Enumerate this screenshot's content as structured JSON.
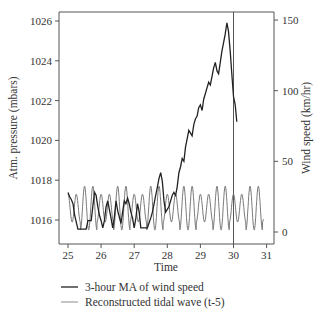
{
  "chart_data": {
    "type": "line",
    "title": "",
    "xlabel": "Time",
    "ylabel_left": "Atm. pressure (mbars)",
    "ylabel_right": "Wind speed (km/hr)",
    "xlim": [
      25,
      31
    ],
    "ylim_left": [
      1015.2,
      1026.5
    ],
    "ylim_right": [
      -8,
      150
    ],
    "x_ticks": [
      "25",
      "26",
      "27",
      "28",
      "29",
      "30",
      "31"
    ],
    "y_left_ticks": [
      "1016",
      "1018",
      "1020",
      "1022",
      "1024",
      "1026"
    ],
    "y_right_ticks": [
      "0",
      "50",
      "100",
      "150"
    ],
    "grid": false,
    "vertical_marker_x": 30,
    "legend_position": "bottom",
    "series": [
      {
        "name": "3-hour MA of wind speed",
        "axis": "right",
        "color": "#222222",
        "x": [
          25.0,
          25.05,
          25.1,
          25.15,
          25.2,
          25.3,
          25.4,
          25.5,
          25.55,
          25.6,
          25.65,
          25.7,
          25.75,
          25.8,
          25.85,
          25.9,
          25.95,
          26.0,
          26.05,
          26.1,
          26.15,
          26.2,
          26.3,
          26.35,
          26.4,
          26.45,
          26.5,
          26.6,
          26.65,
          26.7,
          26.75,
          26.8,
          26.85,
          26.9,
          26.95,
          27.0,
          27.05,
          27.1,
          27.15,
          27.2,
          27.3,
          27.4,
          27.5,
          27.55,
          27.6,
          27.65,
          27.7,
          27.75,
          27.8,
          27.85,
          27.9,
          27.95,
          28.0,
          28.05,
          28.1,
          28.15,
          28.2,
          28.25,
          28.3,
          28.35,
          28.4,
          28.45,
          28.5,
          28.55,
          28.6,
          28.65,
          28.7,
          28.75,
          28.8,
          28.85,
          28.9,
          28.95,
          29.0,
          29.05,
          29.1,
          29.15,
          29.2,
          29.25,
          29.3,
          29.35,
          29.4,
          29.45,
          29.5,
          29.55,
          29.6,
          29.65,
          29.7,
          29.75,
          29.8,
          29.85,
          29.9,
          29.95,
          30.0,
          30.05,
          30.1
        ],
        "values": [
          28,
          25,
          23,
          20,
          12,
          2,
          2,
          2,
          2,
          8,
          8,
          8,
          18,
          28,
          26,
          18,
          12,
          8,
          3,
          8,
          18,
          22,
          10,
          3,
          10,
          22,
          15,
          6,
          14,
          22,
          20,
          24,
          20,
          14,
          10,
          3,
          10,
          20,
          14,
          3,
          3,
          3,
          10,
          14,
          20,
          26,
          32,
          38,
          42,
          36,
          22,
          14,
          16,
          18,
          22,
          26,
          28,
          26,
          32,
          42,
          46,
          52,
          50,
          60,
          66,
          72,
          70,
          68,
          76,
          80,
          82,
          88,
          90,
          86,
          94,
          98,
          102,
          106,
          104,
          110,
          116,
          120,
          114,
          112,
          120,
          128,
          134,
          140,
          148,
          142,
          128,
          112,
          96,
          90,
          78
        ],
        "unit": "km/hr"
      },
      {
        "name": "Reconstructed tidal wave (t-5)",
        "axis": "left",
        "color": "#7a7a7a",
        "unit": "mbar",
        "x_start": 25.0,
        "x_end": 30.9,
        "period_days": 0.5,
        "mean_mbar": 1016.6,
        "amplitude_mbar": [
          1.1,
          0.7
        ],
        "description": "Semi-diurnal oscillation between ~1015.6 and ~1017.7 mbar with alternating high/low peaks"
      }
    ]
  },
  "axes": {
    "x_title": "Time",
    "left_title": "Atm. pressure (mbars)",
    "right_title": "Wind speed (km/hr)"
  },
  "legend": {
    "items": [
      {
        "label": "3-hour MA of wind speed",
        "color": "#222222"
      },
      {
        "label": "Reconstructed tidal wave (t-5)",
        "color": "#7a7a7a"
      }
    ]
  }
}
